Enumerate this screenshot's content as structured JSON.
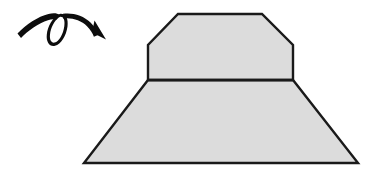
{
  "canvas": {
    "width": 373,
    "height": 174,
    "background_color": "#ffffff",
    "title": "Rotation of a solid figure"
  },
  "style": {
    "fill_color": "#dcdcdc",
    "stroke_color": "#1a1a1a",
    "stroke_width": 2.4,
    "arrow_color": "#0d0d0d"
  },
  "shapes": [
    {
      "name": "upper-chamfered-trapezoid",
      "label": "Upper block with chamfered top corners",
      "fill": "#dcdcdc",
      "stroke": "#1a1a1a",
      "points": "178,14 262,14 293,45 293,80 148,80 148,45"
    },
    {
      "name": "lower-trapezoid",
      "label": "Lower flaring trapezoid base",
      "fill": "#dcdcdc",
      "stroke": "#1a1a1a",
      "points": "148,80 293,80 358,163 84,163"
    }
  ],
  "divider": {
    "name": "horizontal-divider-line",
    "label": "Edge between upper block and lower base",
    "from_x": 148,
    "from_y": 80,
    "to_x": 293,
    "to_y": 80
  },
  "arrow": {
    "name": "looping-rotation-arrow",
    "label": "Curved looping arrow indicating rotation",
    "color": "#0d0d0d",
    "direction": "clockwise-right",
    "tail": {
      "x": 18,
      "y": 30
    },
    "loop_center": {
      "x": 58,
      "y": 28
    },
    "tip": {
      "x": 106,
      "y": 39
    }
  }
}
